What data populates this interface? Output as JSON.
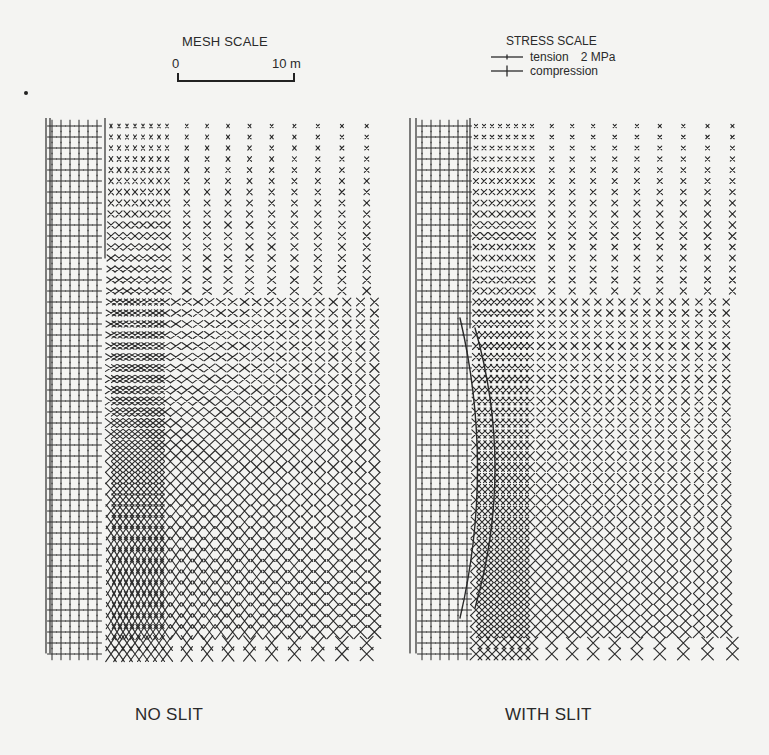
{
  "figure": {
    "mesh_scale": {
      "title": "MESH SCALE",
      "start_label": "0",
      "end_label": "10 m"
    },
    "stress_scale": {
      "title": "STRESS SCALE",
      "tension_label": "tension",
      "magnitude_label": "2 MPa",
      "compression_label": "compression"
    },
    "panels": [
      {
        "id": "no-slit",
        "caption": "NO SLIT",
        "has_slit": false
      },
      {
        "id": "with-slit",
        "caption": "WITH SLIT",
        "has_slit": true
      }
    ],
    "colors": {
      "ink": "#2a2a2a",
      "paper": "#f4f4f2"
    }
  }
}
